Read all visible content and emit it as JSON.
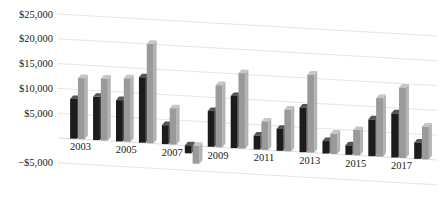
{
  "chart_data": {
    "type": "bar",
    "title": "",
    "subtitle": "",
    "xlabel": "",
    "ylabel": "",
    "grid": true,
    "legend": "none",
    "ylim": [
      -5000,
      25000
    ],
    "yticks": [
      25000,
      20000,
      15000,
      10000,
      5000,
      -5000
    ],
    "ytick_labels": [
      "$25,000",
      "$20,000",
      "$15,000",
      "$10,000",
      "$5,000",
      "−$5,000"
    ],
    "categories": [
      "2003",
      "2004",
      "2005",
      "2006",
      "2007",
      "2008",
      "2009",
      "2010",
      "2011",
      "2012",
      "2013",
      "2014",
      "2015",
      "2016",
      "2017",
      "2018"
    ],
    "xtick_labels_shown": [
      "2003",
      "2005",
      "2007",
      "2009",
      "2011",
      "2013",
      "2015",
      "2017"
    ],
    "series": [
      {
        "name": "Series 1",
        "color": "#1c1c1c",
        "values": [
          8000,
          8700,
          8300,
          13200,
          3800,
          -1600,
          7200,
          10500,
          2800,
          4400,
          9000,
          2500,
          1900,
          7400,
          8900,
          3300
        ]
      },
      {
        "name": "Series 2",
        "color": "#9a9a9a",
        "values": [
          12300,
          12500,
          12800,
          20000,
          7300,
          -3600,
          12500,
          15200,
          5700,
          8400,
          15700,
          4100,
          5100,
          11800,
          14200,
          6600
        ]
      }
    ]
  },
  "colors": {
    "series1": "#1c1c1c",
    "series1_side": "#3d3d3d",
    "series1_top": "#565656",
    "series2": "#9a9a9a",
    "series2_side": "#b3b3b3",
    "series2_top": "#c6c6c6",
    "gridline": "#d8d8d8",
    "text": "#1a1a1a",
    "background": "#ffffff"
  }
}
